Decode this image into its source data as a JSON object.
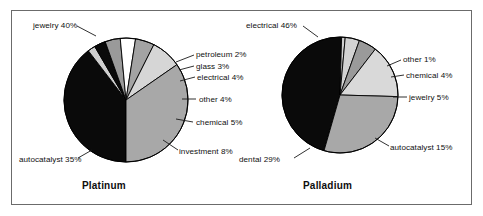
{
  "figure": {
    "background_color": "#ffffff",
    "frame_color": "#6b6b6b"
  },
  "chart_data": [
    {
      "type": "pie",
      "title": "Platinum",
      "name": "platinum-pie",
      "xlabel": "",
      "ylabel": "",
      "categories": [
        "jewelry",
        "petroleum",
        "glass",
        "electrical",
        "other",
        "chemical",
        "investment",
        "autocatalyst"
      ],
      "values": [
        40,
        2,
        3,
        4,
        4,
        5,
        8,
        35
      ],
      "labels": [
        "jewelry 40%",
        "petroleum 2%",
        "glass 3%",
        "electrical 4%",
        "other 4%",
        "chemical 5%",
        "investment 8%",
        "autocatalyst 35%"
      ],
      "colors": [
        "#0a0a0a",
        "#cfcfcf",
        "#0a0a0a",
        "#9a9a9a",
        "#ffffff",
        "#a3a3a3",
        "#d6d6d6",
        "#a8a8a8"
      ],
      "start_angle": 180,
      "direction": "clockwise",
      "center": {
        "x": 126,
        "y": 100
      },
      "radius": 62,
      "legend": "callout-labels",
      "grid": false
    },
    {
      "type": "pie",
      "title": "Palladium",
      "name": "palladium-pie",
      "xlabel": "",
      "ylabel": "",
      "categories": [
        "electrical",
        "other",
        "chemical",
        "jewelry",
        "autocatalyst",
        "dental"
      ],
      "values": [
        46,
        1,
        4,
        5,
        15,
        29
      ],
      "labels": [
        "electrical 46%",
        "other 1%",
        "chemical 4%",
        "jewelry 5%",
        "autocatalyst 15%",
        "dental 29%"
      ],
      "colors": [
        "#0a0a0a",
        "#cfcfcf",
        "#d2d2d2",
        "#9a9a9a",
        "#d9d9d9",
        "#a8a8a8"
      ],
      "start_angle": 196,
      "direction": "clockwise",
      "center": {
        "x": 340,
        "y": 95
      },
      "radius": 58,
      "legend": "callout-labels",
      "grid": false
    }
  ],
  "platinum": {
    "title": "Platinum",
    "labels": {
      "jewelry": "jewelry 40%",
      "petroleum": "petroleum 2%",
      "glass": "glass 3%",
      "electrical": "electrical 4%",
      "other": "other 4%",
      "chemical": "chemical 5%",
      "investment": "investment 8%",
      "autocatalyst": "autocatalyst 35%"
    }
  },
  "palladium": {
    "title": "Palladium",
    "labels": {
      "electrical": "electrical 46%",
      "other": "other 1%",
      "chemical": "chemical 4%",
      "jewelry": "jewelry 5%",
      "autocatalyst": "autocatalyst 15%",
      "dental": "dental 29%"
    }
  }
}
